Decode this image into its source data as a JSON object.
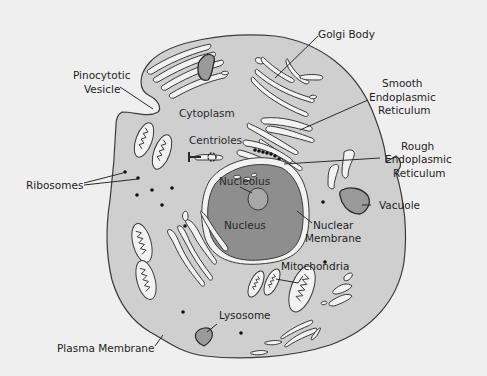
{
  "diagram": {
    "colors": {
      "background": "#efefef",
      "cytoplasm": "#cfcfcf",
      "membrane_stroke": "#3a3a3a",
      "nucleus": "#8e8e8e",
      "nucleolus": "#a8a8a8",
      "vacuole": "#9a9a9a",
      "organelle_fill": "#f2f2f2",
      "text": "#1e1e1e"
    },
    "labels": {
      "golgi_body": "Golgi Body",
      "pinocytotic_vesicle_line1": "Pinocytotic",
      "pinocytotic_vesicle_line2": "Vesicle",
      "cytoplasm": "Cytoplasm",
      "smooth_er_line1": "Smooth",
      "smooth_er_line2": "Endoplasmic",
      "smooth_er_line3": "Reticulum",
      "centrioles": "Centrioles",
      "rough_er_line1": "Rough",
      "rough_er_line2": "Endoplasmic",
      "rough_er_line3": "Reticulum",
      "ribosomes": "Ribosomes",
      "nucleolus": "Nucleolus",
      "nucleus": "Nucleus",
      "vacuole": "Vacuole",
      "nuclear_membrane_line1": "Nuclear",
      "nuclear_membrane_line2": "Membrane",
      "mitochondria": "Mitochondria",
      "lysosome": "Lysosome",
      "plasma_membrane": "Plasma Membrane"
    }
  }
}
